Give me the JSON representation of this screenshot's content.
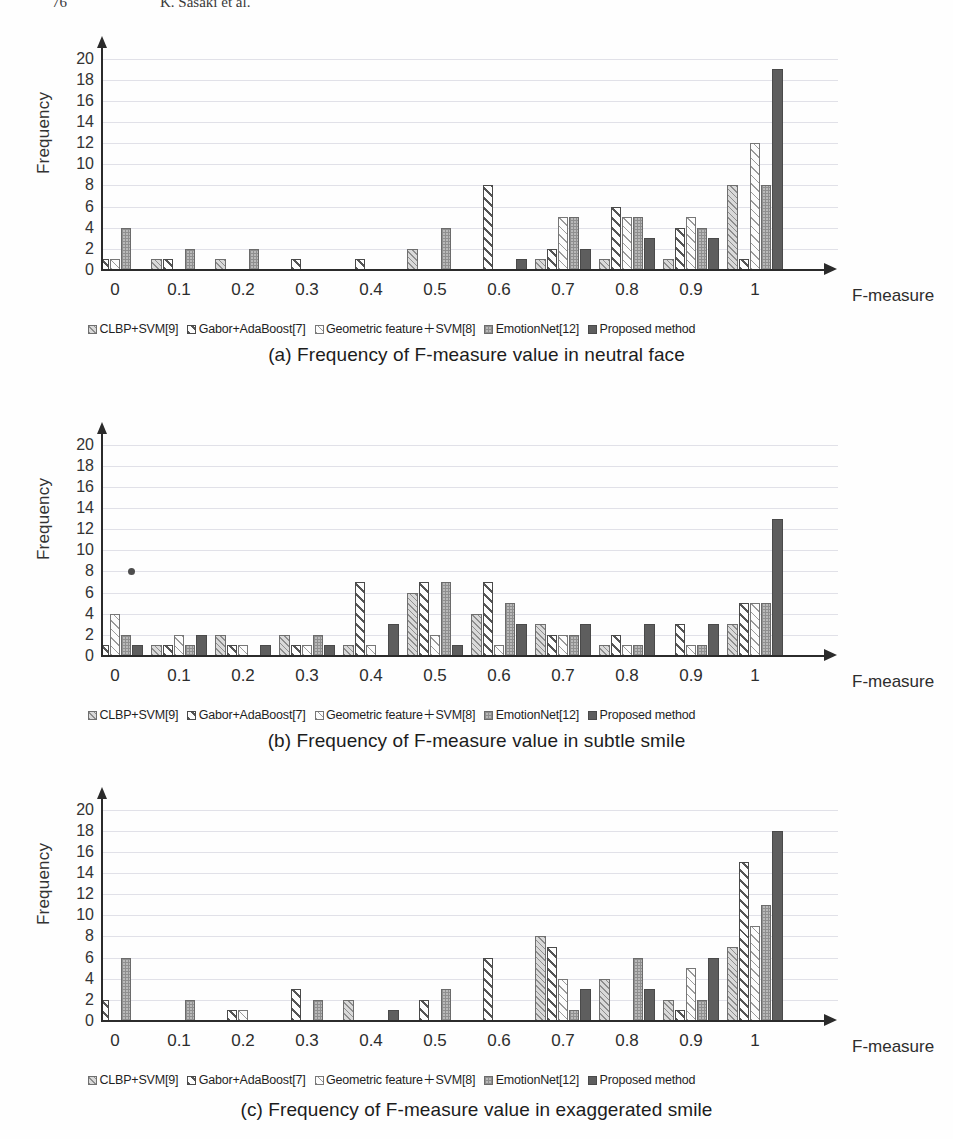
{
  "header": {
    "page_number": "76",
    "running_title": "K. Sasaki et al."
  },
  "axis": {
    "y_label": "Frequency",
    "y_ticks": [
      20,
      18,
      16,
      14,
      12,
      10,
      8,
      6,
      4,
      2,
      0
    ],
    "x_ticks": [
      "0",
      "0.1",
      "0.2",
      "0.3",
      "0.4",
      "0.5",
      "0.6",
      "0.7",
      "0.8",
      "0.9",
      "1"
    ],
    "x_title": "F-measure"
  },
  "legend": [
    {
      "label": "CLBP+SVM[9]",
      "key": "s0"
    },
    {
      "label": "Gabor+AdaBoost[7]",
      "key": "s1"
    },
    {
      "label": "Geometric feature＋SVM[8]",
      "key": "s2"
    },
    {
      "label": "EmotionNet[12]",
      "key": "s3"
    },
    {
      "label": "Proposed method",
      "key": "s4"
    }
  ],
  "figures": [
    {
      "id": "a",
      "caption": "(a) Frequency of F-measure value in neutral face"
    },
    {
      "id": "b",
      "caption": "(b) Frequency of F-measure value in subtle smile"
    },
    {
      "id": "c",
      "caption": "(c) Frequency of F-measure value in exaggerated smile"
    }
  ],
  "chart_data": [
    {
      "type": "bar",
      "title": "(a) Frequency of F-measure value in neutral face",
      "xlabel": "F-measure",
      "ylabel": "Frequency",
      "ylim": [
        0,
        21
      ],
      "grid": true,
      "legend_position": "bottom",
      "categories": [
        "0",
        "0.1",
        "0.2",
        "0.3",
        "0.4",
        "0.5",
        "0.6",
        "0.7",
        "0.8",
        "0.9",
        "1"
      ],
      "series": [
        {
          "name": "CLBP+SVM[9]",
          "values": [
            10,
            1,
            1,
            0,
            0,
            2,
            0,
            1,
            1,
            1,
            8
          ]
        },
        {
          "name": "Gabor+AdaBoost[7]",
          "values": [
            1,
            1,
            0,
            1,
            1,
            0,
            8,
            2,
            6,
            4,
            1
          ]
        },
        {
          "name": "Geometric feature+SVM[8]",
          "values": [
            1,
            0,
            0,
            0,
            0,
            0,
            0,
            5,
            5,
            5,
            12
          ]
        },
        {
          "name": "EmotionNet[12]",
          "values": [
            4,
            2,
            2,
            0,
            0,
            4,
            0,
            5,
            5,
            4,
            8
          ]
        },
        {
          "name": "Proposed method",
          "values": [
            0,
            0,
            0,
            0,
            0,
            0,
            1,
            2,
            3,
            3,
            19
          ]
        }
      ]
    },
    {
      "type": "bar",
      "title": "(b) Frequency of F-measure value in subtle smile",
      "xlabel": "F-measure",
      "ylabel": "Frequency",
      "ylim": [
        0,
        21
      ],
      "grid": true,
      "legend_position": "bottom",
      "categories": [
        "0",
        "0.1",
        "0.2",
        "0.3",
        "0.4",
        "0.5",
        "0.6",
        "0.7",
        "0.8",
        "0.9",
        "1"
      ],
      "series": [
        {
          "name": "CLBP+SVM[9]",
          "values": [
            3,
            1,
            2,
            2,
            1,
            6,
            4,
            3,
            1,
            0,
            3
          ]
        },
        {
          "name": "Gabor+AdaBoost[7]",
          "values": [
            1,
            1,
            1,
            1,
            7,
            7,
            7,
            2,
            2,
            3,
            5
          ]
        },
        {
          "name": "Geometric feature+SVM[8]",
          "values": [
            4,
            2,
            1,
            1,
            1,
            2,
            1,
            2,
            1,
            1,
            5
          ]
        },
        {
          "name": "EmotionNet[12]",
          "values": [
            2,
            1,
            0,
            2,
            0,
            7,
            5,
            2,
            1,
            1,
            5
          ]
        },
        {
          "name": "Proposed method",
          "values": [
            1,
            2,
            1,
            1,
            3,
            1,
            3,
            3,
            3,
            3,
            13
          ]
        }
      ],
      "annotations": [
        {
          "type": "point-marker",
          "x": "0.02",
          "y": 8
        }
      ]
    },
    {
      "type": "bar",
      "title": "(c) Frequency of F-measure value in exaggerated smile",
      "xlabel": "F-measure",
      "ylabel": "Frequency",
      "ylim": [
        0,
        21
      ],
      "grid": true,
      "legend_position": "bottom",
      "categories": [
        "0",
        "0.1",
        "0.2",
        "0.3",
        "0.4",
        "0.5",
        "0.6",
        "0.7",
        "0.8",
        "0.9",
        "1"
      ],
      "series": [
        {
          "name": "CLBP+SVM[9]",
          "values": [
            6,
            0,
            0,
            0,
            2,
            0,
            0,
            8,
            4,
            2,
            7
          ]
        },
        {
          "name": "Gabor+AdaBoost[7]",
          "values": [
            2,
            0,
            1,
            3,
            0,
            2,
            6,
            7,
            0,
            1,
            15
          ]
        },
        {
          "name": "Geometric feature+SVM[8]",
          "values": [
            0,
            0,
            1,
            0,
            0,
            0,
            0,
            4,
            0,
            5,
            9
          ]
        },
        {
          "name": "EmotionNet[12]",
          "values": [
            6,
            2,
            0,
            2,
            0,
            3,
            0,
            1,
            6,
            2,
            11
          ]
        },
        {
          "name": "Proposed method",
          "values": [
            0,
            0,
            0,
            0,
            1,
            0,
            0,
            3,
            3,
            6,
            18
          ]
        }
      ]
    }
  ]
}
